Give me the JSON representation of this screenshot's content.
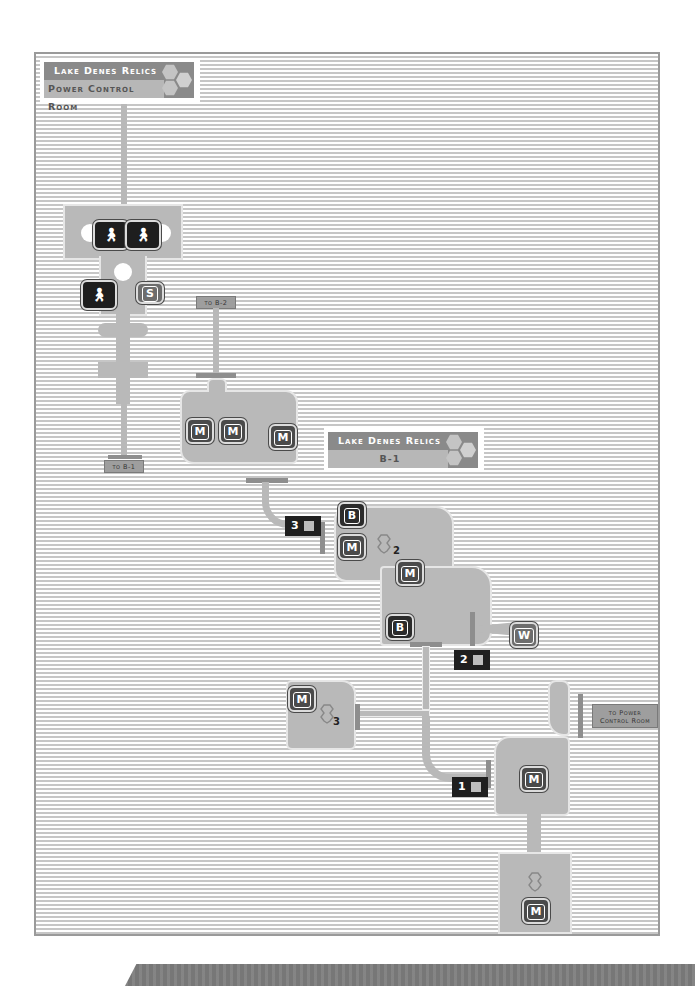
{
  "maps": [
    {
      "area": "Lake Denes Relics",
      "floor": "Power Control Room",
      "exits": [
        {
          "label": "to B-1"
        }
      ],
      "markers": [
        {
          "type": "npc",
          "icon": "person-icon"
        },
        {
          "type": "npc",
          "icon": "person-icon"
        },
        {
          "type": "npc",
          "icon": "person-icon"
        },
        {
          "type": "save",
          "label": "S"
        }
      ]
    },
    {
      "area": "Lake Denes Relics",
      "floor": "B-1",
      "exits": [
        {
          "label": "to B-2"
        },
        {
          "label": "to Power Control Room"
        }
      ],
      "markers": [
        {
          "type": "monster",
          "label": "M"
        },
        {
          "type": "monster",
          "label": "M"
        },
        {
          "type": "monster",
          "label": "M"
        },
        {
          "type": "boss",
          "label": "B"
        },
        {
          "type": "monster",
          "label": "M"
        },
        {
          "type": "monster",
          "label": "M"
        },
        {
          "type": "boss",
          "label": "B"
        },
        {
          "type": "warp",
          "label": "W"
        },
        {
          "type": "monster",
          "label": "M"
        },
        {
          "type": "monster",
          "label": "M"
        },
        {
          "type": "monster",
          "label": "M"
        }
      ],
      "switches": [
        {
          "number": "3"
        },
        {
          "number": "2"
        },
        {
          "number": "1"
        }
      ],
      "stairs": [
        {
          "number": "2"
        },
        {
          "number": "3"
        },
        {
          "number": ""
        }
      ]
    }
  ],
  "banner1": {
    "top": "Lake Denes Relics",
    "bottom": "Power Control Room"
  },
  "banner2": {
    "top": "Lake Denes Relics",
    "bottom": "B-1"
  },
  "exit_labels": {
    "to_b1": "to B-1",
    "to_b2": "to B-2",
    "to_pcr_1": "to Power",
    "to_pcr_2": "Control Room"
  },
  "marker_labels": {
    "M": "M",
    "B": "B",
    "S": "S",
    "W": "W"
  },
  "switch_numbers": {
    "s1": "1",
    "s2": "2",
    "s3": "3"
  },
  "stairs_numbers": {
    "st2": "2",
    "st3": "3"
  },
  "colors": {
    "room": "#b9b9b9",
    "stripe": "#c6c6c6",
    "banner": "#8a8a8a",
    "marker": "#2b2b2b"
  }
}
